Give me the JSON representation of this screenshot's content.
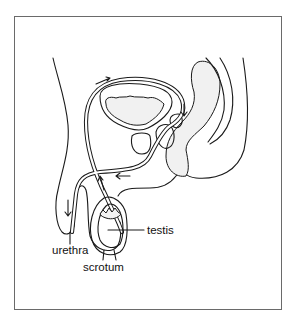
{
  "figure": {
    "type": "anatomical-diagram",
    "labels": [
      {
        "id": "testis",
        "text": "testis"
      },
      {
        "id": "urethra",
        "text": "urethra"
      },
      {
        "id": "scrotum",
        "text": "scrotum"
      }
    ],
    "arrows": [
      "flow-arrow-upper",
      "flow-arrow-right",
      "flow-arrow-lower",
      "flow-arrow-ascending",
      "flow-arrow-penis"
    ],
    "colors": {
      "line": "#1a1a1a",
      "frame": "#6a6a6a",
      "background": "#ffffff"
    }
  }
}
